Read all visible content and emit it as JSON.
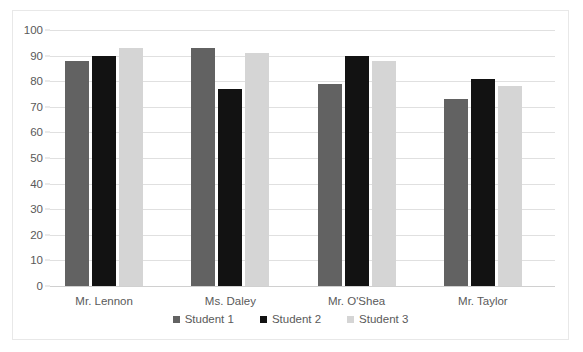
{
  "chart_data": {
    "type": "bar",
    "title": "",
    "xlabel": "",
    "ylabel": "",
    "ylim": [
      0,
      100
    ],
    "ytick_step": 10,
    "yticks": [
      "100",
      "90",
      "80",
      "70",
      "60",
      "50",
      "40",
      "30",
      "20",
      "10",
      "0"
    ],
    "grid": true,
    "legend_position": "bottom",
    "categories": [
      "Mr. Lennon",
      "Ms. Daley",
      "Mr. O'Shea",
      "Mr. Taylor"
    ],
    "series": [
      {
        "name": "Student 1",
        "color": "#626262",
        "values": [
          88,
          93,
          79,
          73
        ]
      },
      {
        "name": "Student 2",
        "color": "#121212",
        "values": [
          90,
          77,
          90,
          81
        ]
      },
      {
        "name": "Student 3",
        "color": "#d5d5d5",
        "values": [
          93,
          91,
          88,
          78
        ]
      }
    ]
  },
  "legend": {
    "items": [
      {
        "label": "Student 1"
      },
      {
        "label": "Student 2"
      },
      {
        "label": "Student 3"
      }
    ]
  },
  "axis": {
    "y": {
      "t100": "100",
      "t90": "90",
      "t80": "80",
      "t70": "70",
      "t60": "60",
      "t50": "50",
      "t40": "40",
      "t30": "30",
      "t20": "20",
      "t10": "10",
      "t0": "0"
    },
    "x": {
      "c0": "Mr. Lennon",
      "c1": "Ms. Daley",
      "c2": "Mr. O'Shea",
      "c3": "Mr. Taylor"
    }
  }
}
